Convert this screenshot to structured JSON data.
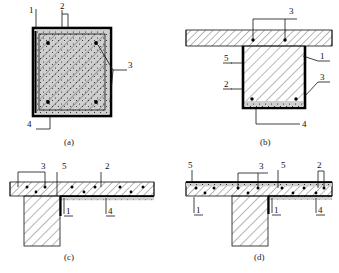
{
  "figure": {
    "panels": [
      {
        "key": "a",
        "caption": "(a)",
        "type": "rectangular-column-section",
        "labels": [
          {
            "id": "a-1",
            "text": "1",
            "underline": false
          },
          {
            "id": "a-2",
            "text": "2",
            "underline": false
          },
          {
            "id": "a-3",
            "text": "3",
            "underline": false
          },
          {
            "id": "a-4",
            "text": "4",
            "underline": false
          }
        ]
      },
      {
        "key": "b",
        "caption": "(b)",
        "type": "beam-with-slab-section",
        "labels": [
          {
            "id": "b-3t",
            "text": "3",
            "underline": false
          },
          {
            "id": "b-5",
            "text": "5",
            "underline": true
          },
          {
            "id": "b-2",
            "text": "2",
            "underline": true
          },
          {
            "id": "b-1",
            "text": "1",
            "underline": true
          },
          {
            "id": "b-3r",
            "text": "3",
            "underline": true
          },
          {
            "id": "b-4",
            "text": "4",
            "underline": false
          }
        ]
      },
      {
        "key": "c",
        "caption": "(c)",
        "type": "edge-tee-slab-section",
        "labels": [
          {
            "id": "c-3",
            "text": "3",
            "underline": false
          },
          {
            "id": "c-5",
            "text": "5",
            "underline": false
          },
          {
            "id": "c-2",
            "text": "2",
            "underline": false
          },
          {
            "id": "c-1",
            "text": "1",
            "underline": true
          },
          {
            "id": "c-4",
            "text": "4",
            "underline": true
          }
        ]
      },
      {
        "key": "d",
        "caption": "(d)",
        "type": "interior-tee-slab-section",
        "labels": [
          {
            "id": "d-5l",
            "text": "5",
            "underline": false
          },
          {
            "id": "d-3",
            "text": "3",
            "underline": false
          },
          {
            "id": "d-5r",
            "text": "5",
            "underline": false
          },
          {
            "id": "d-2",
            "text": "2",
            "underline": false
          },
          {
            "id": "d-1l",
            "text": "1",
            "underline": true
          },
          {
            "id": "d-1r",
            "text": "1",
            "underline": true
          },
          {
            "id": "d-4",
            "text": "4",
            "underline": true
          }
        ]
      }
    ],
    "colors": {
      "line": "#111111",
      "hatch": "#333333",
      "fill": "#ffffff",
      "heavy": "#000000",
      "dot": "#000000"
    }
  }
}
